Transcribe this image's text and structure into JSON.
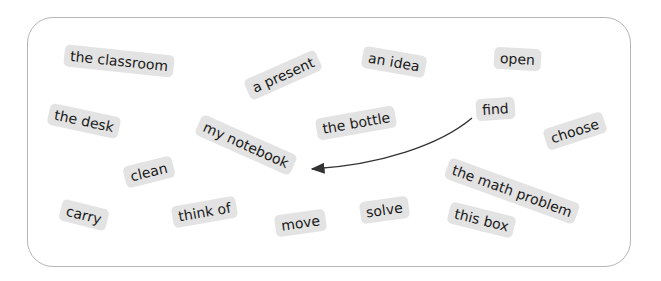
{
  "board": {
    "border_color": "#b5b5b5",
    "chip_color": "#e3e3e3",
    "words": [
      {
        "id": "the-classroom",
        "label": "the classroom"
      },
      {
        "id": "a-present",
        "label": "a present"
      },
      {
        "id": "an-idea",
        "label": "an idea"
      },
      {
        "id": "open",
        "label": "open"
      },
      {
        "id": "the-desk",
        "label": "the desk"
      },
      {
        "id": "my-notebook",
        "label": "my notebook"
      },
      {
        "id": "the-bottle",
        "label": "the bottle"
      },
      {
        "id": "find",
        "label": "find"
      },
      {
        "id": "choose",
        "label": "choose"
      },
      {
        "id": "clean",
        "label": "clean"
      },
      {
        "id": "the-math-problem",
        "label": "the math problem"
      },
      {
        "id": "carry",
        "label": "carry"
      },
      {
        "id": "think-of",
        "label": "think of"
      },
      {
        "id": "move",
        "label": "move"
      },
      {
        "id": "solve",
        "label": "solve"
      },
      {
        "id": "this-box",
        "label": "this box"
      }
    ],
    "arrow": {
      "from": "find",
      "to": "my notebook"
    }
  }
}
